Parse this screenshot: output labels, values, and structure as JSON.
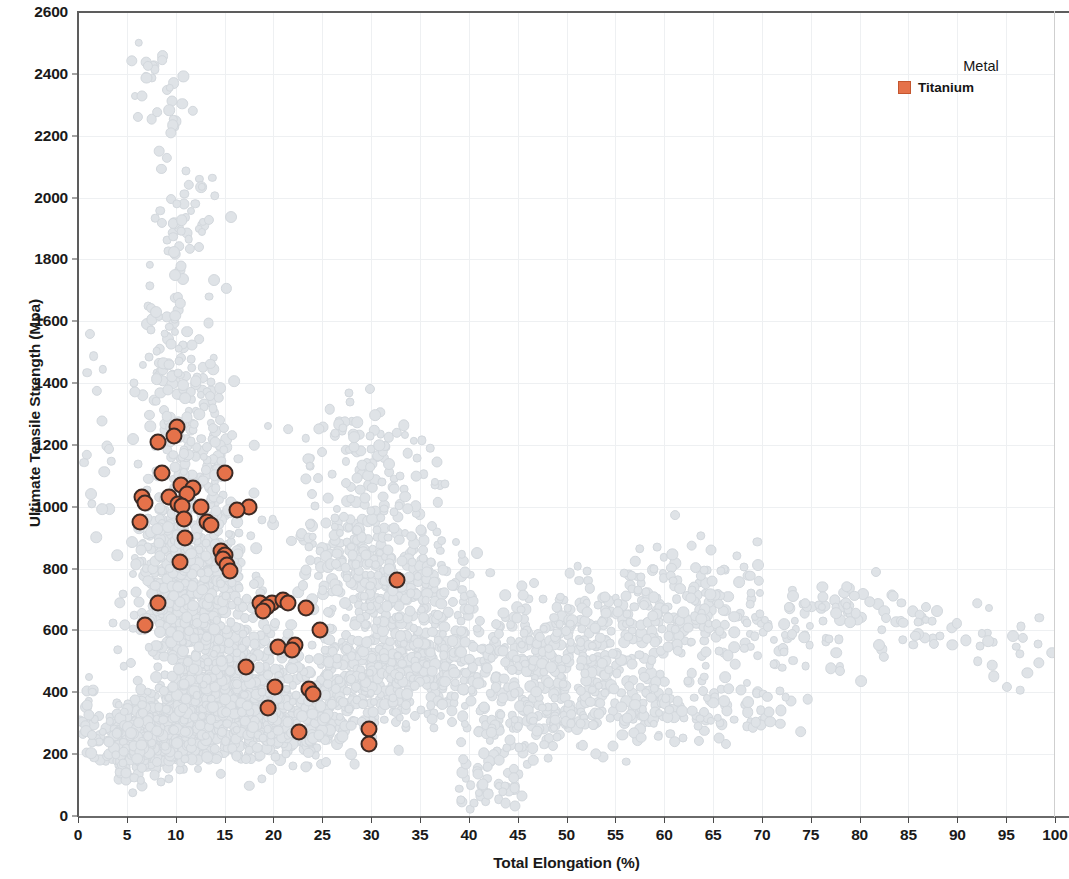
{
  "chart_data": {
    "type": "scatter",
    "title": "",
    "xlabel": "Total Elongation (%)",
    "ylabel": "Ultimate Tensile Strength (Mpa)",
    "xlim": [
      0,
      100
    ],
    "ylim": [
      0,
      2600
    ],
    "xticks": [
      0,
      5,
      10,
      15,
      20,
      25,
      30,
      35,
      40,
      45,
      50,
      55,
      60,
      65,
      70,
      75,
      80,
      85,
      90,
      95,
      100
    ],
    "yticks": [
      0,
      200,
      400,
      600,
      800,
      1000,
      1200,
      1400,
      1600,
      1800,
      2000,
      2200,
      2400,
      2600
    ],
    "grid": true,
    "grid_color": "#eef0f2",
    "legend": {
      "title": "Metal",
      "position": "top-right",
      "entries": [
        {
          "label": "Titanium",
          "color": "#e5724a",
          "marker": "square"
        }
      ]
    },
    "series": [
      {
        "name": "Titanium",
        "color": "#e5724a",
        "edge_color": "#3b2a25",
        "marker": "circle",
        "highlighted": true,
        "points": [
          [
            10.1,
            1258
          ],
          [
            9.8,
            1230
          ],
          [
            8.2,
            1208
          ],
          [
            8.6,
            1110
          ],
          [
            15.0,
            1108
          ],
          [
            10.5,
            1072
          ],
          [
            11.8,
            1060
          ],
          [
            11.2,
            1040
          ],
          [
            9.3,
            1032
          ],
          [
            6.5,
            1030
          ],
          [
            6.9,
            1012
          ],
          [
            10.2,
            1008
          ],
          [
            10.6,
            1002
          ],
          [
            12.6,
            1000
          ],
          [
            17.5,
            998
          ],
          [
            16.3,
            990
          ],
          [
            10.8,
            962
          ],
          [
            6.3,
            952
          ],
          [
            13.2,
            950
          ],
          [
            13.6,
            940
          ],
          [
            11.0,
            900
          ],
          [
            14.6,
            858
          ],
          [
            15.0,
            845
          ],
          [
            14.8,
            830
          ],
          [
            10.4,
            822
          ],
          [
            15.2,
            812
          ],
          [
            15.6,
            792
          ],
          [
            32.6,
            762
          ],
          [
            18.6,
            690
          ],
          [
            8.2,
            688
          ],
          [
            19.9,
            688
          ],
          [
            21.0,
            700
          ],
          [
            21.5,
            690
          ],
          [
            19.3,
            676
          ],
          [
            23.3,
            672
          ],
          [
            18.9,
            662
          ],
          [
            24.8,
            602
          ],
          [
            6.9,
            618
          ],
          [
            22.2,
            552
          ],
          [
            20.5,
            548
          ],
          [
            21.9,
            538
          ],
          [
            17.2,
            482
          ],
          [
            20.2,
            418
          ],
          [
            23.6,
            412
          ],
          [
            24.1,
            396
          ],
          [
            19.4,
            350
          ],
          [
            22.6,
            272
          ],
          [
            29.8,
            282
          ],
          [
            29.8,
            232
          ]
        ]
      },
      {
        "name": "Background (all metals)",
        "color": "#dfe3e7",
        "marker": "circle",
        "highlighted": false,
        "note": "Faint light-grey reference cloud of all other alloy records"
      }
    ]
  },
  "axes": {
    "y_title": "Ultimate Tensile Strength (Mpa)",
    "x_title": "Total Elongation (%)",
    "y_tick_labels": [
      "0",
      "200",
      "400",
      "600",
      "800",
      "1000",
      "1200",
      "1400",
      "1600",
      "1800",
      "2000",
      "2200",
      "2400",
      "2600"
    ],
    "x_tick_labels": [
      "0",
      "5",
      "10",
      "15",
      "20",
      "25",
      "30",
      "35",
      "40",
      "45",
      "50",
      "55",
      "60",
      "65",
      "70",
      "75",
      "80",
      "85",
      "90",
      "95",
      "100"
    ]
  },
  "legend": {
    "title": "Metal",
    "items": [
      {
        "label": "Titanium",
        "color": "#e5724a"
      }
    ]
  },
  "colors": {
    "titanium_fill": "#e5724a",
    "titanium_edge": "#3b2a25",
    "background_point": "#dfe3e7",
    "grid": "#eef0f2",
    "axis": "#5d5d5d",
    "text": "#1a1a1a"
  }
}
